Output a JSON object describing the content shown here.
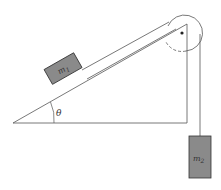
{
  "diagram": {
    "angle_label": "θ",
    "mass1_label": "m",
    "mass1_sub": "1",
    "mass2_label": "m",
    "mass2_sub": "2",
    "colors": {
      "line": "#444444",
      "block_fill": "#8a8a8a",
      "block_stroke": "#333333",
      "background": "#ffffff"
    }
  }
}
